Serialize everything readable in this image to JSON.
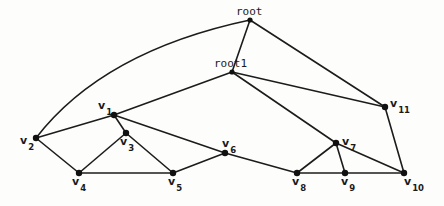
{
  "diagram": {
    "type": "graph",
    "colors": {
      "edge": "#1c1c1c",
      "node": "#111111",
      "background": "#fdfdfb"
    },
    "nodes": [
      {
        "id": "root",
        "base": "root",
        "sub": "",
        "x": 250,
        "y": 20,
        "lx": 236,
        "ly": 6
      },
      {
        "id": "root1",
        "base": "root1",
        "sub": "",
        "x": 232,
        "y": 72,
        "lx": 214,
        "ly": 58
      },
      {
        "id": "v1",
        "base": "v",
        "sub": "1",
        "x": 114,
        "y": 115,
        "lx": 98,
        "ly": 100
      },
      {
        "id": "v2",
        "base": "v",
        "sub": "2",
        "x": 36,
        "y": 138,
        "lx": 20,
        "ly": 135
      },
      {
        "id": "v3",
        "base": "v",
        "sub": "3",
        "x": 126,
        "y": 133,
        "lx": 120,
        "ly": 136
      },
      {
        "id": "v4",
        "base": "v",
        "sub": "4",
        "x": 79,
        "y": 173,
        "lx": 72,
        "ly": 176
      },
      {
        "id": "v5",
        "base": "v",
        "sub": "5",
        "x": 173,
        "y": 173,
        "lx": 168,
        "ly": 176
      },
      {
        "id": "v6",
        "base": "v",
        "sub": "6",
        "x": 225,
        "y": 153,
        "lx": 222,
        "ly": 138
      },
      {
        "id": "v7",
        "base": "v",
        "sub": "7",
        "x": 336,
        "y": 143,
        "lx": 342,
        "ly": 136
      },
      {
        "id": "v8",
        "base": "v",
        "sub": "8",
        "x": 297,
        "y": 173,
        "lx": 292,
        "ly": 176
      },
      {
        "id": "v9",
        "base": "v",
        "sub": "9",
        "x": 345,
        "y": 173,
        "lx": 341,
        "ly": 176
      },
      {
        "id": "v10",
        "base": "v",
        "sub": "10",
        "x": 404,
        "y": 173,
        "lx": 404,
        "ly": 176
      },
      {
        "id": "v11",
        "base": "v",
        "sub": "11",
        "x": 385,
        "y": 107,
        "lx": 390,
        "ly": 98
      }
    ],
    "edges": [
      {
        "from": "root",
        "to": "v2",
        "curve": true
      },
      {
        "from": "root",
        "to": "root1"
      },
      {
        "from": "root",
        "to": "v11"
      },
      {
        "from": "root1",
        "to": "v1"
      },
      {
        "from": "root1",
        "to": "v7"
      },
      {
        "from": "root1",
        "to": "v11"
      },
      {
        "from": "v1",
        "to": "v2"
      },
      {
        "from": "v1",
        "to": "v3"
      },
      {
        "from": "v1",
        "to": "v6"
      },
      {
        "from": "v2",
        "to": "v4"
      },
      {
        "from": "v3",
        "to": "v4"
      },
      {
        "from": "v3",
        "to": "v5"
      },
      {
        "from": "v4",
        "to": "v5"
      },
      {
        "from": "v5",
        "to": "v6"
      },
      {
        "from": "v6",
        "to": "v8"
      },
      {
        "from": "v8",
        "to": "v7"
      },
      {
        "from": "v7",
        "to": "v9"
      },
      {
        "from": "v7",
        "to": "v10"
      },
      {
        "from": "v8",
        "to": "v9"
      },
      {
        "from": "v9",
        "to": "v10"
      },
      {
        "from": "v10",
        "to": "v11"
      }
    ]
  }
}
